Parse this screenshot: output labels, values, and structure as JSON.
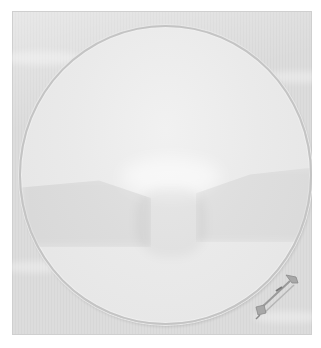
{
  "image": {
    "subject": "embroidery hoop on white fabric",
    "colors": {
      "fabric": "#dcdcdc",
      "hoop_inner": "#eaeaea",
      "hoop_ring": "#c4c4c4",
      "clasp_metal": "#9a9a9a"
    }
  }
}
